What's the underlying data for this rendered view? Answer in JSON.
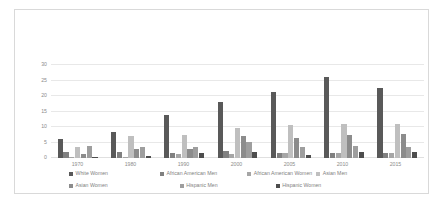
{
  "chart_data": {
    "type": "bar",
    "title": "",
    "xlabel": "",
    "ylabel": "",
    "ylim": [
      0,
      30
    ],
    "yticks": [
      0,
      5,
      10,
      15,
      20,
      25,
      30
    ],
    "grid": true,
    "legend_position": "bottom",
    "categories": [
      "1970",
      "1980",
      "1990",
      "2000",
      "2005",
      "2010",
      "2015"
    ],
    "series": [
      {
        "name": "White Women",
        "color": "#595959",
        "values": [
          6.2,
          8.3,
          14.0,
          18.0,
          21.3,
          26.0,
          22.7
        ]
      },
      {
        "name": "African American Men",
        "color": "#808080",
        "values": [
          1.8,
          2.0,
          1.7,
          2.3,
          1.6,
          1.5,
          1.5
        ]
      },
      {
        "name": "African American Women",
        "color": "#a6a6a6",
        "values": [
          0.1,
          0.2,
          1.2,
          1.4,
          1.6,
          1.5,
          1.5
        ]
      },
      {
        "name": "Asian Men",
        "color": "#bfbfbf",
        "values": [
          3.4,
          7.1,
          7.4,
          9.8,
          10.5,
          11.0,
          11.0
        ]
      },
      {
        "name": "Asian Women",
        "color": "#8c8c8c",
        "values": [
          1.3,
          2.8,
          3.0,
          7.0,
          6.3,
          7.5,
          7.8
        ]
      },
      {
        "name": "Hispanic Men",
        "color": "#9e9e9e",
        "values": [
          3.9,
          3.5,
          3.6,
          5.2,
          3.5,
          3.8,
          3.6
        ]
      },
      {
        "name": "Hispanic Women",
        "color": "#4d4d4d",
        "values": [
          0.2,
          0.5,
          1.5,
          1.8,
          1.1,
          1.8,
          2.1
        ]
      }
    ]
  }
}
